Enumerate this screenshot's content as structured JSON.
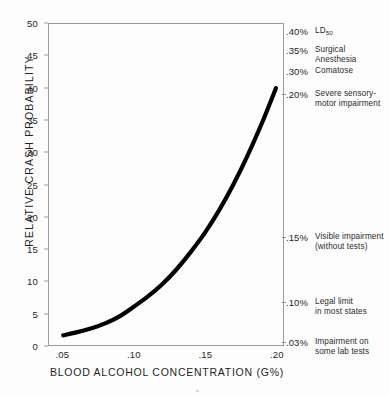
{
  "chart_data": {
    "type": "line",
    "title": "",
    "xlabel": "BLOOD ALCOHOL CONCENTRATION (G%)",
    "ylabel": "RELATIVE CRASH PROBABILITY",
    "xlim": [
      0.04,
      0.205
    ],
    "ylim": [
      0,
      50
    ],
    "grid": false,
    "legend": "none",
    "x_ticks": [
      ".05",
      ".10",
      ".15",
      ".20"
    ],
    "x_tick_values": [
      0.05,
      0.1,
      0.15,
      0.2
    ],
    "y_ticks": [
      "0",
      "5",
      "10",
      "15",
      "20",
      "25",
      "30",
      "35",
      "40",
      "45",
      "50"
    ],
    "y_tick_values": [
      0,
      5,
      10,
      15,
      20,
      25,
      30,
      35,
      40,
      45,
      50
    ],
    "series": [
      {
        "name": "Relative crash probability",
        "color": "#000000",
        "x": [
          0.05,
          0.06,
          0.07,
          0.08,
          0.09,
          0.1,
          0.11,
          0.12,
          0.13,
          0.14,
          0.15,
          0.16,
          0.17,
          0.18,
          0.19,
          0.2
        ],
        "values": [
          1.5,
          2.0,
          2.6,
          3.4,
          4.5,
          6.0,
          7.6,
          9.5,
          11.8,
          14.5,
          17.5,
          21.0,
          25.0,
          29.5,
          34.5,
          40.0
        ]
      }
    ]
  },
  "right_axis": {
    "annotations": [
      {
        "value": ".40%",
        "line1": "LD",
        "sub": "50",
        "line2": "",
        "tick": false
      },
      {
        "value": ".35%",
        "line1": "Surgical",
        "line2": "Anesthesia",
        "tick": false
      },
      {
        "value": ".30%",
        "line1": "Comatose",
        "line2": "",
        "tick": false
      },
      {
        "value": ".20%",
        "line1": "Severe sensory-",
        "line2": "motor impairment",
        "tick": true
      },
      {
        "value": ".15%",
        "line1": "Visible impairment",
        "line2": "(without tests)",
        "tick": true
      },
      {
        "value": ".10%",
        "line1": "Legal limit",
        "line2": "in most states",
        "tick": true
      },
      {
        "value": ".03%",
        "line1": "Impairment on",
        "line2": "some lab tests",
        "tick": true
      }
    ]
  }
}
